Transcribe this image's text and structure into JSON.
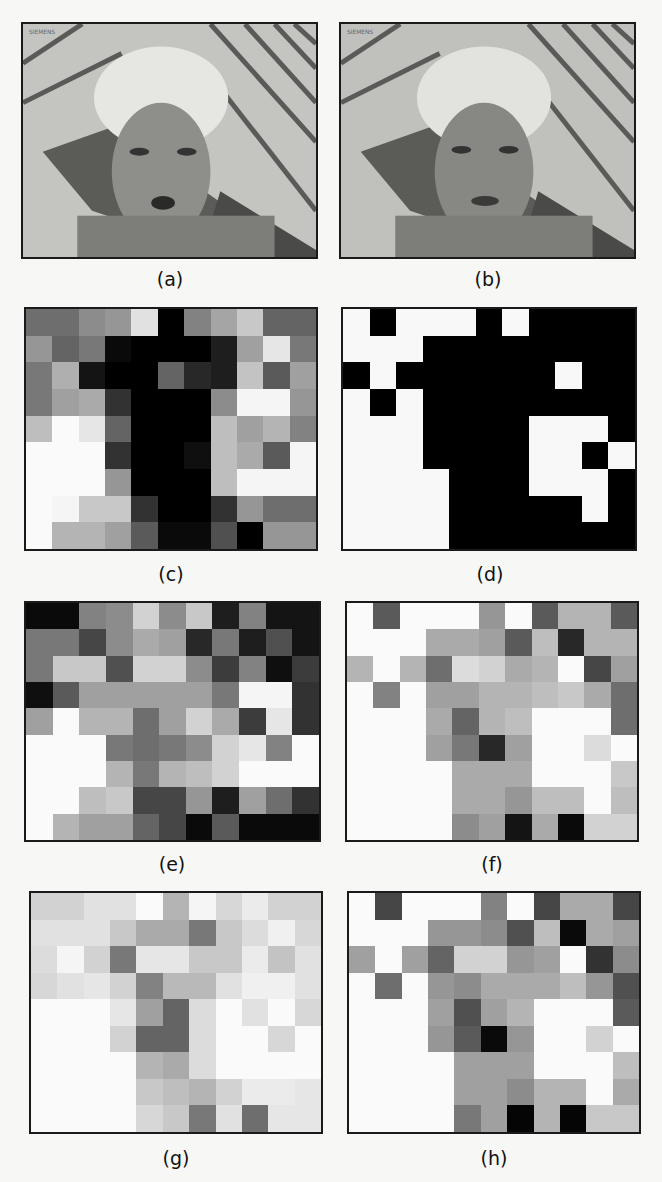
{
  "figure": {
    "panels": [
      {
        "id": "a",
        "label": "(a)",
        "type": "image",
        "description": "video frame: man in hard hat, original",
        "overlay_text": "SIEMENS"
      },
      {
        "id": "b",
        "label": "(b)",
        "type": "image",
        "description": "video frame: man in hard hat, later frame",
        "overlay_text": "SIEMENS"
      },
      {
        "id": "c",
        "label": "(c)",
        "type": "grayscale-grid",
        "cols": 11,
        "rows": 9,
        "values": [
          [
            110,
            110,
            140,
            150,
            225,
            0,
            130,
            165,
            200,
            100,
            100
          ],
          [
            150,
            100,
            120,
            10,
            0,
            0,
            0,
            30,
            160,
            230,
            120
          ],
          [
            120,
            175,
            20,
            0,
            0,
            100,
            40,
            30,
            195,
            90,
            160
          ],
          [
            120,
            160,
            170,
            50,
            0,
            0,
            0,
            140,
            245,
            245,
            150
          ],
          [
            190,
            250,
            230,
            100,
            0,
            0,
            0,
            190,
            160,
            180,
            130
          ],
          [
            250,
            250,
            250,
            50,
            0,
            0,
            15,
            190,
            170,
            90,
            245
          ],
          [
            250,
            250,
            250,
            150,
            0,
            0,
            0,
            190,
            245,
            245,
            245
          ],
          [
            250,
            245,
            200,
            200,
            50,
            0,
            0,
            50,
            150,
            110,
            110
          ],
          [
            250,
            180,
            180,
            160,
            90,
            10,
            10,
            80,
            0,
            150,
            150
          ]
        ]
      },
      {
        "id": "d",
        "label": "(d)",
        "type": "binary-grid",
        "cols": 11,
        "rows": 9,
        "values": [
          [
            1,
            0,
            1,
            1,
            1,
            0,
            1,
            0,
            0,
            0,
            0
          ],
          [
            1,
            1,
            1,
            0,
            0,
            0,
            0,
            0,
            0,
            0,
            0
          ],
          [
            0,
            1,
            0,
            0,
            0,
            0,
            0,
            0,
            1,
            0,
            0
          ],
          [
            1,
            0,
            1,
            0,
            0,
            0,
            0,
            0,
            0,
            0,
            0
          ],
          [
            1,
            1,
            1,
            0,
            0,
            0,
            0,
            1,
            1,
            1,
            0
          ],
          [
            1,
            1,
            1,
            0,
            0,
            0,
            0,
            1,
            1,
            0,
            1
          ],
          [
            1,
            1,
            1,
            1,
            0,
            0,
            0,
            1,
            1,
            1,
            0
          ],
          [
            1,
            1,
            1,
            1,
            0,
            0,
            0,
            0,
            0,
            1,
            0
          ],
          [
            1,
            1,
            1,
            1,
            0,
            0,
            0,
            0,
            0,
            0,
            0
          ]
        ]
      },
      {
        "id": "e",
        "label": "(e)",
        "type": "grayscale-grid",
        "cols": 11,
        "rows": 9,
        "values": [
          [
            10,
            10,
            130,
            140,
            210,
            140,
            200,
            30,
            130,
            20,
            20
          ],
          [
            120,
            120,
            70,
            140,
            170,
            160,
            40,
            120,
            30,
            80,
            20
          ],
          [
            120,
            200,
            200,
            80,
            210,
            210,
            140,
            60,
            130,
            15,
            60
          ],
          [
            15,
            90,
            160,
            160,
            160,
            160,
            160,
            120,
            245,
            245,
            50
          ],
          [
            160,
            250,
            180,
            180,
            110,
            160,
            210,
            170,
            60,
            230,
            50
          ],
          [
            250,
            250,
            250,
            120,
            110,
            120,
            140,
            210,
            230,
            130,
            250
          ],
          [
            250,
            250,
            250,
            180,
            120,
            180,
            190,
            210,
            250,
            250,
            250
          ],
          [
            250,
            250,
            190,
            200,
            70,
            70,
            150,
            30,
            160,
            110,
            50
          ],
          [
            250,
            180,
            160,
            160,
            100,
            70,
            10,
            90,
            10,
            10,
            10
          ]
        ]
      },
      {
        "id": "f",
        "label": "(f)",
        "type": "grayscale-grid",
        "cols": 11,
        "rows": 9,
        "values": [
          [
            250,
            90,
            250,
            250,
            250,
            150,
            250,
            90,
            180,
            180,
            90
          ],
          [
            250,
            250,
            250,
            170,
            170,
            160,
            90,
            190,
            40,
            180,
            180
          ],
          [
            180,
            250,
            180,
            110,
            220,
            210,
            170,
            180,
            250,
            70,
            160
          ],
          [
            250,
            130,
            250,
            160,
            160,
            180,
            180,
            190,
            200,
            170,
            110
          ],
          [
            250,
            250,
            250,
            170,
            100,
            180,
            190,
            250,
            250,
            250,
            110
          ],
          [
            250,
            250,
            250,
            160,
            120,
            40,
            160,
            250,
            250,
            220,
            250
          ],
          [
            250,
            250,
            250,
            250,
            170,
            170,
            170,
            250,
            250,
            250,
            200
          ],
          [
            250,
            250,
            250,
            250,
            170,
            170,
            150,
            190,
            190,
            250,
            190
          ],
          [
            250,
            250,
            250,
            250,
            140,
            160,
            20,
            170,
            10,
            210,
            210
          ]
        ]
      },
      {
        "id": "g",
        "label": "(g)",
        "type": "grayscale-grid",
        "cols": 11,
        "rows": 9,
        "values": [
          [
            210,
            210,
            225,
            225,
            250,
            180,
            245,
            215,
            235,
            210,
            210
          ],
          [
            225,
            225,
            225,
            200,
            170,
            170,
            120,
            200,
            220,
            240,
            215
          ],
          [
            220,
            245,
            210,
            120,
            230,
            230,
            200,
            200,
            235,
            195,
            225
          ],
          [
            215,
            225,
            230,
            210,
            130,
            185,
            185,
            225,
            240,
            240,
            225
          ],
          [
            250,
            250,
            250,
            230,
            160,
            100,
            220,
            250,
            225,
            250,
            215
          ],
          [
            250,
            250,
            250,
            210,
            100,
            100,
            220,
            250,
            250,
            215,
            250
          ],
          [
            250,
            250,
            250,
            250,
            180,
            170,
            220,
            250,
            250,
            250,
            250
          ],
          [
            250,
            250,
            250,
            250,
            200,
            190,
            180,
            210,
            235,
            235,
            230
          ],
          [
            250,
            250,
            250,
            250,
            215,
            200,
            120,
            225,
            110,
            230,
            230
          ]
        ]
      },
      {
        "id": "h",
        "label": "(h)",
        "type": "grayscale-grid",
        "cols": 11,
        "rows": 9,
        "values": [
          [
            250,
            70,
            250,
            250,
            250,
            130,
            250,
            70,
            170,
            170,
            70
          ],
          [
            250,
            250,
            250,
            150,
            150,
            140,
            80,
            190,
            10,
            170,
            160
          ],
          [
            160,
            250,
            160,
            100,
            210,
            210,
            150,
            160,
            250,
            50,
            140
          ],
          [
            250,
            110,
            250,
            150,
            140,
            170,
            170,
            170,
            190,
            150,
            80
          ],
          [
            250,
            250,
            250,
            160,
            80,
            160,
            180,
            250,
            250,
            250,
            90
          ],
          [
            250,
            250,
            250,
            150,
            90,
            10,
            150,
            250,
            250,
            210,
            250
          ],
          [
            250,
            250,
            250,
            250,
            160,
            160,
            160,
            250,
            250,
            250,
            190
          ],
          [
            250,
            250,
            250,
            250,
            160,
            160,
            140,
            180,
            180,
            250,
            170
          ],
          [
            250,
            250,
            250,
            250,
            120,
            160,
            5,
            180,
            5,
            200,
            200
          ]
        ]
      }
    ]
  }
}
